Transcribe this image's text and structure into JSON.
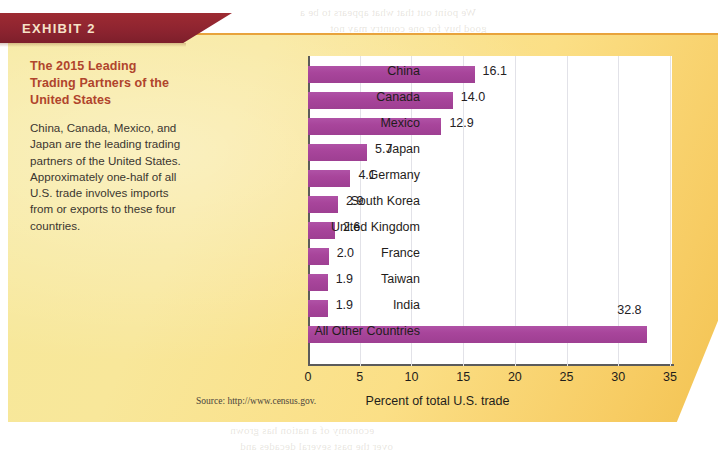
{
  "banner": {
    "label": "EXHIBIT 2"
  },
  "caption": {
    "title": "The 2015 Leading Trading Partners of the United States",
    "body": "China, Canada, Mexico, and Japan are the leading trading partners of the United States. Approximately one-half of all U.S. trade involves imports from or exports to these four countries."
  },
  "source": "Source: http://www.census.gov.",
  "colors": {
    "bar": "#a8459b",
    "banner": "#8e2430",
    "panel_light": "#f6e89a",
    "panel_dark": "#f3c352",
    "caption_title": "#b0442c",
    "gridline": "#e2e2e8",
    "axis": "#5b5b5b"
  },
  "chart_data": {
    "type": "bar",
    "orientation": "horizontal",
    "title": "The 2015 Leading Trading Partners of the United States",
    "xlabel": "Percent of total U.S. trade",
    "ylabel": "",
    "xlim": [
      0,
      35
    ],
    "xticks": [
      0,
      5,
      10,
      15,
      20,
      25,
      30,
      35
    ],
    "xticklabels": [
      "0",
      "5",
      "10",
      "15",
      "20",
      "25",
      "30",
      "35"
    ],
    "grid": true,
    "legend": false,
    "categories": [
      "China",
      "Canada",
      "Mexico",
      "Japan",
      "Germany",
      "South Korea",
      "United Kingdom",
      "France",
      "Taiwan",
      "India",
      "All Other Countries"
    ],
    "values": [
      16.1,
      14.0,
      12.9,
      5.7,
      4.1,
      2.9,
      2.6,
      2.0,
      1.9,
      1.9,
      32.8
    ],
    "data_labels": [
      "16.1",
      "14.0",
      "12.9",
      "5.7",
      "4.1",
      "2.9",
      "2.6",
      "2.0",
      "1.9",
      "1.9",
      "32.8"
    ]
  },
  "bleed_text": [
    "We point out that what appears to be a",
    "good buy for one country may not",
    "be the same for another. Some",
    "countries export products to",
    "markets abroad and import",
    "goods they need at home.",
    "16-1 THE IMPORTANCE OF",
    "THE GLOBAL ECONOMY",
    "the role that trade plays in the",
    "economy of a nation has grown",
    "over the past several decades and"
  ]
}
